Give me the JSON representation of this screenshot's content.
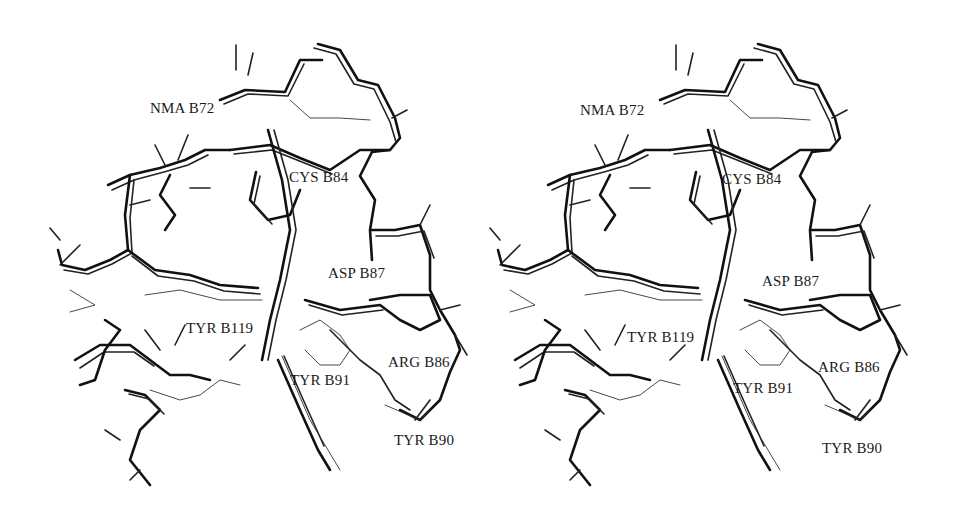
{
  "figure": {
    "type": "stereo pair molecular structure (wireframe)",
    "panels": [
      {
        "id": "left",
        "labels": [
          {
            "text": "NMA B72",
            "x": 150,
            "y": 101
          },
          {
            "text": "CYS B84",
            "x": 289,
            "y": 170
          },
          {
            "text": "ASP B87",
            "x": 328,
            "y": 266
          },
          {
            "text": "TYR B119",
            "x": 186,
            "y": 321
          },
          {
            "text": "TYR B91",
            "x": 290,
            "y": 373
          },
          {
            "text": "ARG B86",
            "x": 388,
            "y": 355
          },
          {
            "text": "TYR B90",
            "x": 394,
            "y": 433
          }
        ]
      },
      {
        "id": "right",
        "labels": [
          {
            "text": "NMA B72",
            "x": 580,
            "y": 103
          },
          {
            "text": "CYS B84",
            "x": 722,
            "y": 172
          },
          {
            "text": "ASP B87",
            "x": 762,
            "y": 274
          },
          {
            "text": "TYR B119",
            "x": 627,
            "y": 330
          },
          {
            "text": "TYR B91",
            "x": 733,
            "y": 381
          },
          {
            "text": "ARG B86",
            "x": 818,
            "y": 360
          },
          {
            "text": "TYR B90",
            "x": 822,
            "y": 441
          }
        ]
      }
    ]
  }
}
